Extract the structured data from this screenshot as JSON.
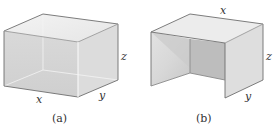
{
  "figures": [
    {
      "id": "a",
      "caption": "(a)",
      "description": "Closed rectangular box",
      "labels": {
        "x": "x",
        "y": "y",
        "z": "z"
      }
    },
    {
      "id": "b",
      "caption": "(b)",
      "description": "Open box with top, back and two side walls (no front or bottom)",
      "labels": {
        "x": "x",
        "y": "y",
        "z": "z"
      }
    }
  ],
  "colors": {
    "edge": "#6e6e6e",
    "face_light": "#e9e9e9",
    "face_mid": "#d6d6d6",
    "face_dark": "#bdbdbd"
  }
}
